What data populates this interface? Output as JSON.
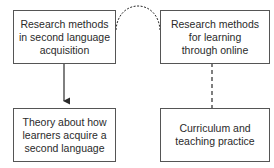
{
  "diagram": {
    "nodes": [
      {
        "id": "rm-sla",
        "lines": [
          "Research methods",
          "in second language",
          "acquisition"
        ]
      },
      {
        "id": "rm-online",
        "lines": [
          "Research methods",
          "for learning",
          "through online"
        ]
      },
      {
        "id": "theory",
        "lines": [
          "Theory about how",
          "learners acquire a",
          "second language"
        ]
      },
      {
        "id": "curriculum",
        "lines": [
          "Curriculum and",
          "teaching practice"
        ]
      }
    ],
    "edges": [
      {
        "from": "rm-sla",
        "to": "theory",
        "style": "solid-arrow"
      },
      {
        "from": "rm-sla",
        "to": "rm-online",
        "style": "dashed-arc"
      },
      {
        "from": "rm-online",
        "to": "curriculum",
        "style": "dashed-line"
      }
    ],
    "colors": {
      "line": "#2a2a2a",
      "border": "#555555",
      "background": "#ffffff"
    }
  }
}
